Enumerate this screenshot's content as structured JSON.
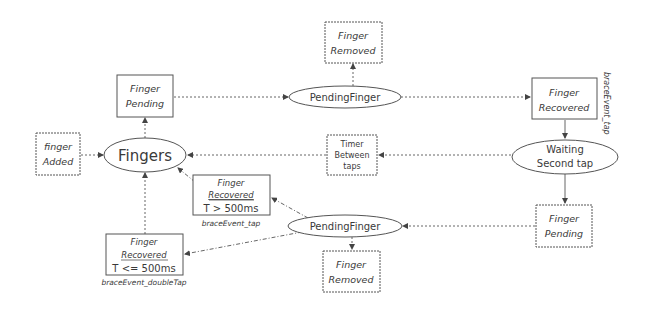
{
  "colors": {
    "stroke": "#5a5a5a",
    "text": "#3a3a3a",
    "background": "#ffffff"
  },
  "nodes": {
    "finger_added": {
      "line1": "finger",
      "line2": "Added"
    },
    "fingers": {
      "label": "Fingers"
    },
    "finger_pending_top": {
      "line1": "Finger",
      "line2": "Pending"
    },
    "finger_removed_top": {
      "line1": "Finger",
      "line2": "Removed"
    },
    "pending_finger_top": {
      "label": "PendingFinger"
    },
    "finger_recovered_top": {
      "line1": "Finger",
      "line2": "Recovered",
      "side_label": "braceEvent_tap"
    },
    "waiting_second_tap": {
      "line1": "Waiting",
      "line2": "Second tap"
    },
    "timer_between_taps": {
      "line1": "Timer",
      "line2": "Between",
      "line3": "taps"
    },
    "finger_recovered_gt": {
      "line1": "Finger",
      "line2": "Recovered",
      "line3": "T > 500ms",
      "caption": "braceEvent_tap"
    },
    "finger_recovered_le": {
      "line1": "Finger",
      "line2": "Recovered",
      "line3": "T <= 500ms",
      "caption": "braceEvent_doubleTap"
    },
    "pending_finger_bottom": {
      "label": "PendingFinger"
    },
    "finger_removed_bottom": {
      "line1": "Finger",
      "line2": "Removed"
    },
    "finger_pending_bottom": {
      "line1": "Finger",
      "line2": "Pending"
    }
  }
}
